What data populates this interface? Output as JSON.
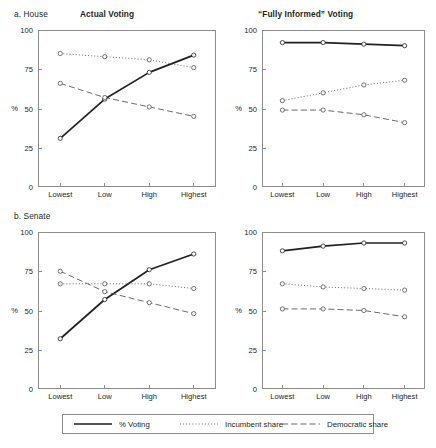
{
  "figure": {
    "row_labels": [
      "a. House",
      "b. Senate"
    ],
    "column_titles": [
      "Actual Voting",
      "“Fully Informed” Voting"
    ],
    "axis": {
      "y_label": "%",
      "y_ticks": [
        "0",
        "25",
        "50",
        "75",
        "100"
      ],
      "x_ticks": [
        "Lowest",
        "Low",
        "High",
        "Highest"
      ]
    },
    "legend": {
      "items": [
        {
          "label": "% Voting",
          "style": "solid",
          "color": "#231f20"
        },
        {
          "label": "Incumbent share",
          "style": "dotted",
          "color": "#5c5c5c"
        },
        {
          "label": "Democratic share",
          "style": "dashed",
          "color": "#5c5c5c"
        }
      ]
    }
  },
  "chart_data": [
    {
      "type": "line",
      "panel": "a-house-actual",
      "title": "Actual Voting",
      "row": "a. House",
      "xlabel": "",
      "ylabel": "%",
      "ylim": [
        0,
        100
      ],
      "yticks": [
        0,
        25,
        50,
        75,
        100
      ],
      "grid": false,
      "categories": [
        "Lowest",
        "Low",
        "High",
        "Highest"
      ],
      "series": [
        {
          "name": "% Voting",
          "style": "solid",
          "values": [
            31,
            56,
            73,
            84
          ]
        },
        {
          "name": "Incumbent share",
          "style": "dotted",
          "values": [
            85,
            83,
            81,
            76
          ]
        },
        {
          "name": "Democratic share",
          "style": "dashed",
          "values": [
            66,
            57,
            51,
            45
          ]
        }
      ]
    },
    {
      "type": "line",
      "panel": "a-house-fully-informed",
      "title": "“Fully Informed” Voting",
      "row": "a. House",
      "xlabel": "",
      "ylabel": "%",
      "ylim": [
        0,
        100
      ],
      "yticks": [
        0,
        25,
        50,
        75,
        100
      ],
      "grid": false,
      "categories": [
        "Lowest",
        "Low",
        "High",
        "Highest"
      ],
      "series": [
        {
          "name": "% Voting",
          "style": "solid",
          "values": [
            92,
            92,
            91,
            90
          ]
        },
        {
          "name": "Incumbent share",
          "style": "dotted",
          "values": [
            55,
            60,
            65,
            68
          ]
        },
        {
          "name": "Democratic share",
          "style": "dashed",
          "values": [
            49,
            49,
            46,
            41
          ]
        }
      ]
    },
    {
      "type": "line",
      "panel": "b-senate-actual",
      "title": "Actual Voting",
      "row": "b. Senate",
      "xlabel": "",
      "ylabel": "%",
      "ylim": [
        0,
        100
      ],
      "yticks": [
        0,
        25,
        50,
        75,
        100
      ],
      "grid": false,
      "categories": [
        "Lowest",
        "Low",
        "High",
        "Highest"
      ],
      "series": [
        {
          "name": "% Voting",
          "style": "solid",
          "values": [
            32,
            57,
            76,
            86
          ]
        },
        {
          "name": "Incumbent share",
          "style": "dotted",
          "values": [
            67,
            67,
            67,
            64
          ]
        },
        {
          "name": "Democratic share",
          "style": "dashed",
          "values": [
            75,
            62,
            55,
            48
          ]
        }
      ]
    },
    {
      "type": "line",
      "panel": "b-senate-fully-informed",
      "title": "“Fully Informed” Voting",
      "row": "b. Senate",
      "xlabel": "",
      "ylabel": "%",
      "ylim": [
        0,
        100
      ],
      "yticks": [
        0,
        25,
        50,
        75,
        100
      ],
      "grid": false,
      "categories": [
        "Lowest",
        "Low",
        "High",
        "Highest"
      ],
      "series": [
        {
          "name": "% Voting",
          "style": "solid",
          "values": [
            88,
            91,
            93,
            93
          ]
        },
        {
          "name": "Incumbent share",
          "style": "dotted",
          "values": [
            67,
            65,
            64,
            63
          ]
        },
        {
          "name": "Democratic share",
          "style": "dashed",
          "values": [
            51,
            51,
            50,
            46
          ]
        }
      ]
    }
  ]
}
